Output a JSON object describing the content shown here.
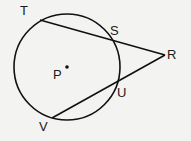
{
  "diagram": {
    "circle": {
      "center_label": "P",
      "cx": 67,
      "cy": 67,
      "r": 53
    },
    "points": {
      "T": {
        "label": "T",
        "x": 40,
        "y": 20
      },
      "S": {
        "label": "S",
        "x": 111,
        "y": 38
      },
      "R": {
        "label": "R",
        "x": 165,
        "y": 55
      },
      "U": {
        "label": "U",
        "x": 117,
        "y": 82
      },
      "V": {
        "label": "V",
        "x": 52,
        "y": 118
      },
      "P": {
        "label": "P",
        "x": 67,
        "y": 67
      }
    },
    "segments": [
      [
        "T",
        "R"
      ],
      [
        "V",
        "R"
      ]
    ],
    "stroke_color": "#111111"
  }
}
